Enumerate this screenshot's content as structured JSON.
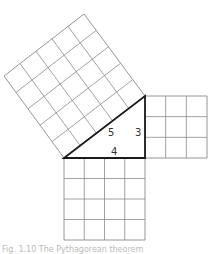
{
  "diagram": {
    "triangle": {
      "vertices": {
        "right_angle": [
          145,
          158
        ],
        "left": [
          64,
          158
        ],
        "top": [
          145,
          96
        ]
      },
      "side_labels": {
        "hypotenuse": "5",
        "vertical_leg": "3",
        "horizontal_leg": "4"
      }
    },
    "squares": [
      {
        "name": "square-on-leg-3",
        "side": 3,
        "cells": 9,
        "corners": [
          [
            145,
            96
          ],
          [
            207,
            96
          ],
          [
            207,
            158
          ],
          [
            145,
            158
          ]
        ]
      },
      {
        "name": "square-on-leg-4",
        "side": 4,
        "cells": 16,
        "corners": [
          [
            64,
            158
          ],
          [
            145,
            158
          ],
          [
            145,
            240
          ],
          [
            64,
            240
          ]
        ]
      },
      {
        "name": "square-on-hypotenuse-5",
        "side": 5,
        "cells": 25,
        "corners": [
          [
            64,
            158
          ],
          [
            145,
            96
          ],
          [
            84,
            14
          ],
          [
            4,
            76
          ]
        ]
      }
    ],
    "colors": {
      "grid": "#8a8a8a",
      "triangle": "#1a1a1a",
      "background": "#ffffff"
    }
  },
  "caption": {
    "text": "Fig. 1.10  The Pythagorean theorem"
  }
}
